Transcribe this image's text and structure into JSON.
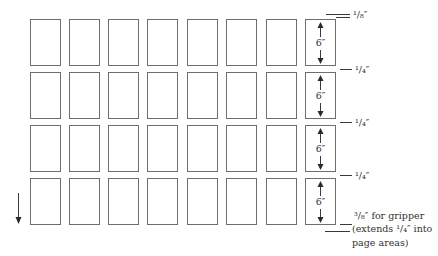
{
  "diagram": {
    "type": "print-imposition-layout",
    "grid": {
      "rows": 4,
      "columns": 8,
      "col_x": [
        30,
        69,
        108,
        147,
        187,
        226,
        266,
        305
      ],
      "row_y": [
        19,
        72,
        125,
        178
      ],
      "page_width": 31,
      "page_height": 48
    },
    "page_dimension_label": "6″",
    "margin_labels": {
      "top": "¹/₈″",
      "gap_1": "¹/₄″",
      "gap_2": "¹/₄″",
      "gap_3": "¹/₄″"
    },
    "gripper_note": {
      "line1": "³/₈″ for gripper",
      "line2": "(extends ¹/₄″ into",
      "line3": "page areas)"
    },
    "feed_direction_arrow": "down-arrow",
    "colors": {
      "line": "#6e6e6e",
      "text": "#333333",
      "background": "#ffffff"
    }
  }
}
